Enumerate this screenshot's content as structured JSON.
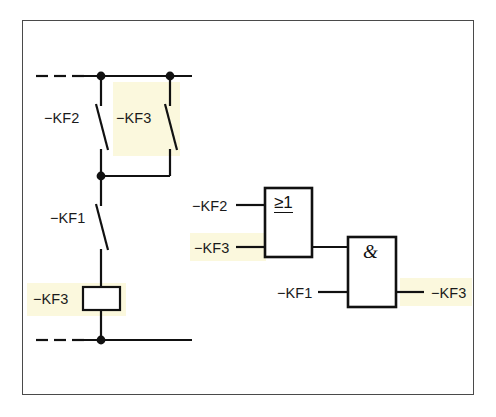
{
  "figure": {
    "border_color": "#4a4a4a",
    "line_color": "#111111",
    "highlight_color": "#fbf8dd",
    "background_color": "#ffffff"
  },
  "ladder": {
    "name": "relay-ladder-circuit",
    "top_rail": {
      "dashed_left": true,
      "y": 76
    },
    "bottom_rail": {
      "dashed_left": true,
      "y": 340
    },
    "contacts": [
      {
        "id": "contact-kf2",
        "label": "−KF2",
        "type": "normally-closed-contact",
        "highlighted": false
      },
      {
        "id": "contact-kf3",
        "label": "−KF3",
        "type": "normally-closed-contact",
        "highlighted": true
      },
      {
        "id": "contact-kf1",
        "label": "−KF1",
        "type": "normally-closed-contact",
        "highlighted": false
      }
    ],
    "coil": {
      "id": "coil-kf3",
      "label": "−KF3",
      "type": "relay-coil",
      "highlighted": true
    },
    "junction_dots": 4
  },
  "logic": {
    "name": "logic-gate-diagram",
    "gates": [
      {
        "id": "or-gate",
        "symbol": "≥1",
        "type": "OR",
        "inputs": [
          {
            "label": "−KF2",
            "highlighted": false
          },
          {
            "label": "−KF3",
            "highlighted": true
          }
        ]
      },
      {
        "id": "and-gate",
        "symbol": "&",
        "type": "AND",
        "inputs": [
          {
            "label": "",
            "source": "or-gate-output",
            "highlighted": false
          },
          {
            "label": "−KF1",
            "highlighted": false
          }
        ],
        "output": {
          "label": "−KF3",
          "highlighted": true
        }
      }
    ]
  }
}
